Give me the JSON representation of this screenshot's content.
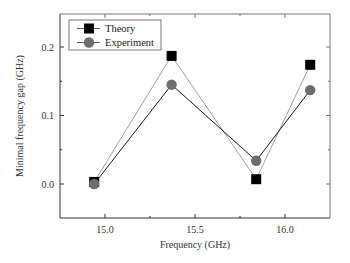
{
  "chart_data": {
    "type": "line",
    "title": "",
    "xlabel": "Frequency (GHz)",
    "ylabel": "Minimal frequency gap (GHz)",
    "xlim": [
      14.75,
      16.25
    ],
    "ylim": [
      -0.05,
      0.25
    ],
    "x_ticks": [
      15.0,
      15.5,
      16.0
    ],
    "x_tick_labels": [
      "15.0",
      "15.5",
      "16.0"
    ],
    "y_ticks": [
      0.0,
      0.1,
      0.2
    ],
    "y_tick_labels": [
      "0.0",
      "0.1",
      "0.2"
    ],
    "grid": false,
    "legend_position": "upper left",
    "x": [
      14.94,
      15.37,
      15.84,
      16.14
    ],
    "series": [
      {
        "name": "Theory",
        "marker": "square",
        "color": "#000000",
        "line_color": "#888888",
        "values": [
          0.003,
          0.187,
          0.007,
          0.174
        ]
      },
      {
        "name": "Experiment",
        "marker": "circle",
        "color": "#6e6e6e",
        "line_color": "#1a1a1a",
        "values": [
          0.0,
          0.145,
          0.034,
          0.137
        ]
      }
    ]
  }
}
